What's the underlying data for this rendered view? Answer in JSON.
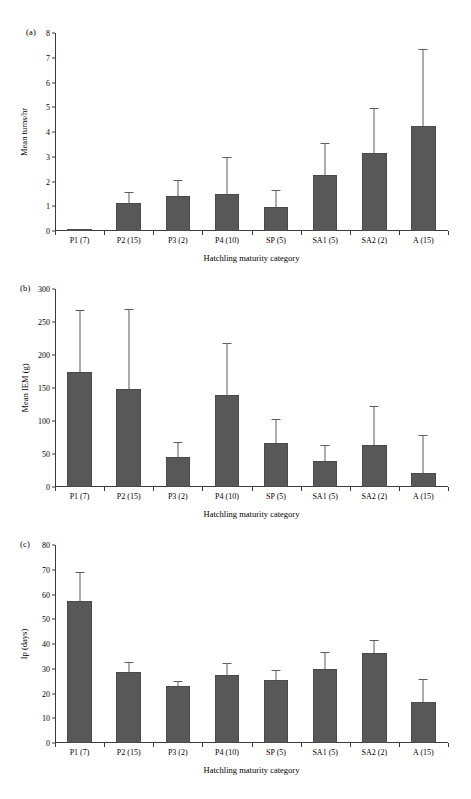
{
  "figure": {
    "categories": [
      "P1 (7)",
      "P2 (15)",
      "P3 (2)",
      "P4 (10)",
      "SP (5)",
      "SA1 (5)",
      "SA2 (2)",
      "A (15)"
    ],
    "xlabel": "Hatchling maturity category",
    "bar_color": "#585858",
    "axis_color": "#3a3a3a"
  },
  "chart_data": [
    {
      "type": "bar",
      "panel": "(a)",
      "title": "",
      "xlabel": "Hatchling maturity category",
      "ylabel": "Mean turns/hr",
      "categories": [
        "P1 (7)",
        "P2 (15)",
        "P3 (2)",
        "P4 (10)",
        "SP (5)",
        "SA1 (5)",
        "SA2 (2)",
        "A (15)"
      ],
      "values": [
        0.02,
        1.12,
        1.43,
        1.48,
        0.98,
        2.26,
        3.17,
        4.23
      ],
      "errors_upper": [
        0.02,
        1.52,
        2.02,
        2.95,
        1.62,
        3.52,
        4.95,
        7.32
      ],
      "ylim": [
        0,
        8
      ],
      "yticks": [
        0,
        1,
        2,
        3,
        4,
        5,
        6,
        7,
        8
      ],
      "grid": false,
      "legend": "none"
    },
    {
      "type": "bar",
      "panel": "(b)",
      "title": "",
      "xlabel": "Hatchling maturity category",
      "ylabel": "Mean IEM (g)",
      "categories": [
        "P1 (7)",
        "P2 (15)",
        "P3 (2)",
        "P4 (10)",
        "SP (5)",
        "SA1 (5)",
        "SA2 (2)",
        "A (15)"
      ],
      "values": [
        175,
        149,
        45,
        140,
        66,
        39,
        64,
        21
      ],
      "errors_upper": [
        267,
        268,
        67,
        216,
        101,
        62,
        121,
        77
      ],
      "ylim": [
        0,
        300
      ],
      "yticks": [
        0,
        50,
        100,
        150,
        200,
        250,
        300
      ],
      "grid": false,
      "legend": "none"
    },
    {
      "type": "bar",
      "panel": "(c)",
      "title": "",
      "xlabel": "Hatchling maturity category",
      "ylabel": "Ip (days)",
      "categories": [
        "P1 (7)",
        "P2 (15)",
        "P3 (2)",
        "P4 (10)",
        "SP (5)",
        "SA1 (5)",
        "SA2 (2)",
        "A (15)"
      ],
      "values": [
        57.5,
        28.7,
        23.0,
        27.5,
        25.6,
        29.9,
        36.3,
        16.7
      ],
      "errors_upper": [
        68.5,
        32.5,
        24.8,
        31.8,
        29.0,
        36.5,
        41.3,
        25.3
      ],
      "ylim": [
        0,
        80
      ],
      "yticks": [
        0,
        10,
        20,
        30,
        40,
        50,
        60,
        70,
        80
      ],
      "grid": false,
      "legend": "none"
    }
  ]
}
